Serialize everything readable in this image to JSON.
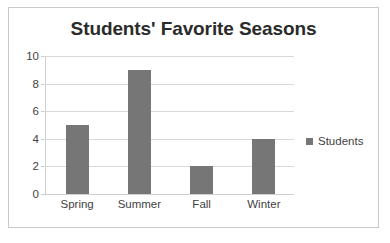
{
  "chart_data": {
    "type": "bar",
    "title": "Students' Favorite Seasons",
    "xlabel": "",
    "ylabel": "",
    "categories": [
      "Spring",
      "Summer",
      "Fall",
      "Winter"
    ],
    "values": [
      5,
      9,
      2,
      4
    ],
    "series": [
      {
        "name": "Students",
        "values": [
          5,
          9,
          2,
          4
        ]
      }
    ],
    "ylim": [
      0,
      10
    ],
    "yticks": [
      0,
      2,
      4,
      6,
      8,
      10
    ],
    "ytick_labels": [
      "0",
      "2",
      "4",
      "6",
      "8",
      "10"
    ],
    "grid": true,
    "legend": {
      "position": "right",
      "entries": [
        "Students"
      ]
    },
    "colors": {
      "bar": "#767676",
      "gridline": "#d9d9d9",
      "axis": "#cfcfcf",
      "border": "#c9c9c9",
      "text": "#3f3f3f",
      "title": "#2b2b2b",
      "background": "#ffffff"
    }
  }
}
